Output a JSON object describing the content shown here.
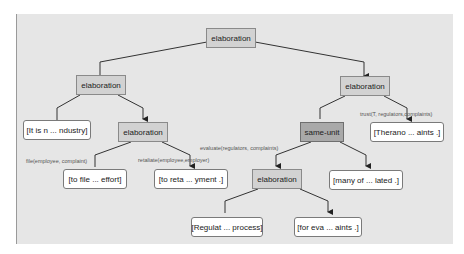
{
  "diagram": {
    "type": "rst-discourse-tree",
    "relations": {
      "root": "elaboration",
      "left_elab": "elaboration",
      "left_inner_elab": "elaboration",
      "right_elab": "elaboration",
      "same_unit": "same-unit",
      "bottom_elab": "elaboration"
    },
    "leaves": {
      "it_is": "[It is n ... ndustry]",
      "to_file": "[to file ...  effort]",
      "to_reta": "[to reta ... yment .]",
      "therano": "[Therano ... aints .]",
      "many_of": "[many of ... lated .]",
      "regulat": "[Regulat ... process]",
      "for_eva": "[for eva ... aints .]"
    },
    "edge_labels": {
      "file": "file(employee, complaint)",
      "retaliate": "retaliate(employee,employer)",
      "evaluate": "evaluate(regulators, complaints)",
      "trust": "trust(T, regulators,complaints)"
    }
  }
}
